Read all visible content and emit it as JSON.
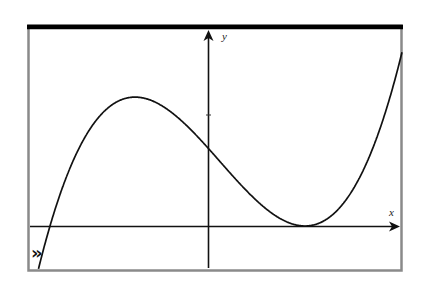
{
  "chart_data": {
    "type": "line",
    "title": "",
    "xlabel": "x",
    "ylabel": "y",
    "function_form": "y = a(x - r1)(x - r2)^2",
    "features": {
      "simple_root": "negative x (left of y-axis)",
      "local_max": "negative x, positive y",
      "y_intercept": "positive",
      "double_root_local_min": "positive x, y = 0",
      "end_behavior": "rises to +infinity as x increases, falls to -infinity as x decreases"
    },
    "grid": false,
    "legend": null,
    "y_axis_ticks": 1,
    "annotations": [
      "»"
    ],
    "colors": {
      "curve": "#111111",
      "axes": "#111111",
      "frame_top": "#000000",
      "frame_sides": "#8a8a8a",
      "background": "#ffffff"
    },
    "pixel_geometry": {
      "frame": {
        "left": 28,
        "top": 25,
        "right": 402,
        "bottom": 270
      },
      "origin_px": [
        208,
        226
      ],
      "simple_root_px": 50,
      "double_root_px": 305,
      "local_max_px": [
        135,
        88
      ],
      "y_intercept_px": 148,
      "y_tick_px": 115
    }
  },
  "labels": {
    "x_axis": "x",
    "y_axis": "y",
    "marker": "»"
  }
}
